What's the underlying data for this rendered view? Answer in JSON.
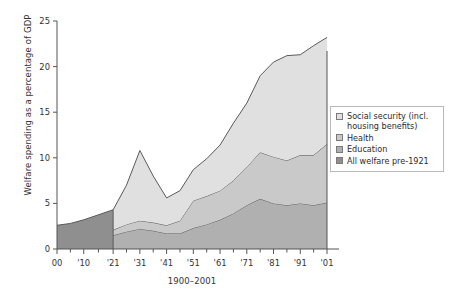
{
  "chart_data": {
    "type": "area",
    "stacked": true,
    "title": "",
    "xlabel": "1900–2001",
    "ylabel": "Welfare spending as a percentage of GDP",
    "xlim": [
      1900,
      2001
    ],
    "ylim": [
      0,
      25
    ],
    "yticks": [
      0,
      5,
      10,
      15,
      20,
      25
    ],
    "ytick_labels": [
      "0",
      "5",
      "10",
      "15",
      "20",
      "25"
    ],
    "xticks": [
      1900,
      1910,
      1921,
      1931,
      1941,
      1951,
      1961,
      1971,
      1981,
      1991,
      2001
    ],
    "xtick_labels": [
      "00",
      "'10",
      "'21",
      "'31",
      "'41",
      "'51",
      "'61",
      "'71",
      "'81",
      "'91",
      "'01"
    ],
    "minor_xticks_between": 1,
    "grid": false,
    "legend_position": "right-middle",
    "colors": {
      "social_security": "#e0e0e0",
      "health": "#c9c9c9",
      "education": "#b0b0b0",
      "all_welfare_pre1921": "#8f8f8f",
      "line": "#5a5a5a",
      "axis": "#555555",
      "background": "#ffffff"
    },
    "series": [
      {
        "name": "All welfare pre-1921",
        "period": "1900-1921",
        "swatch": "#8f8f8f",
        "x": [
          1900,
          1905,
          1910,
          1915,
          1921
        ],
        "values": [
          2.6,
          2.8,
          3.2,
          3.7,
          4.3
        ]
      },
      {
        "name": "Education",
        "period": "1921-2001",
        "swatch": "#b0b0b0",
        "x": [
          1921,
          1926,
          1931,
          1936,
          1941,
          1946,
          1951,
          1956,
          1961,
          1966,
          1971,
          1976,
          1981,
          1986,
          1991,
          1996,
          2001
        ],
        "values": [
          1.5,
          1.9,
          2.2,
          2.0,
          1.7,
          1.7,
          2.3,
          2.7,
          3.2,
          3.9,
          4.8,
          5.5,
          5.0,
          4.8,
          5.0,
          4.8,
          5.1
        ]
      },
      {
        "name": "Health",
        "period": "1921-2001",
        "swatch": "#c9c9c9",
        "x": [
          1921,
          1926,
          1931,
          1936,
          1941,
          1946,
          1951,
          1956,
          1961,
          1966,
          1971,
          1976,
          1981,
          1986,
          1991,
          1996,
          2001
        ],
        "values": [
          0.6,
          0.8,
          0.9,
          0.9,
          0.9,
          1.4,
          3.0,
          3.1,
          3.2,
          3.6,
          4.2,
          5.1,
          5.1,
          4.9,
          5.3,
          5.5,
          6.4
        ]
      },
      {
        "name": "Social security (incl. housing benefits)",
        "period": "1921-2001",
        "swatch": "#e0e0e0",
        "x": [
          1921,
          1926,
          1931,
          1936,
          1941,
          1946,
          1951,
          1956,
          1961,
          1966,
          1971,
          1976,
          1981,
          1986,
          1991,
          1996,
          2001
        ],
        "values": [
          2.2,
          4.3,
          7.7,
          5.1,
          3.0,
          3.3,
          3.4,
          4.1,
          5.0,
          6.3,
          7.0,
          8.4,
          10.4,
          11.5,
          11.0,
          12.0,
          11.7
        ]
      }
    ],
    "stack_totals": {
      "x": [
        1921,
        1926,
        1931,
        1936,
        1941,
        1946,
        1951,
        1956,
        1961,
        1966,
        1971,
        1976,
        1981,
        1986,
        1991,
        1996,
        2001
      ],
      "values": [
        4.3,
        7.0,
        10.8,
        8.0,
        5.6,
        6.4,
        8.7,
        9.9,
        11.4,
        13.8,
        16.0,
        19.0,
        20.5,
        21.2,
        21.3,
        22.3,
        23.2
      ]
    },
    "annotations": []
  },
  "legend": {
    "items": [
      {
        "label": "Social security (incl. housing benefits)",
        "color": "#e0e0e0"
      },
      {
        "label": "Health",
        "color": "#c9c9c9"
      },
      {
        "label": "Education",
        "color": "#b0b0b0"
      },
      {
        "label": "All welfare pre-1921",
        "color": "#8f8f8f"
      }
    ]
  }
}
